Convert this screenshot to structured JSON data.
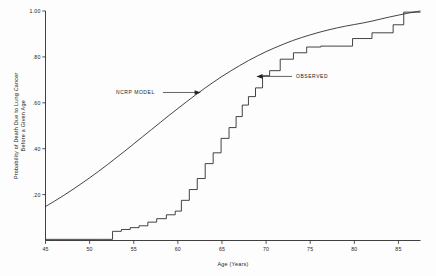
{
  "chart_data": {
    "type": "line",
    "title": "",
    "xlabel": "Age (Years)",
    "ylabel": "Probability of Death Due to Lung Cancer Before a Given Age",
    "ylabel_line1": "Probability of Death Due to Lung Cancer",
    "ylabel_line2": "Before a Given Age",
    "xlim": [
      45,
      87.5
    ],
    "ylim": [
      0,
      1.0
    ],
    "grid": false,
    "legend_position": "inline-annotations",
    "xticks": [
      45,
      50,
      55,
      60,
      65,
      70,
      75,
      80,
      85
    ],
    "xtick_labels": [
      "45",
      "50",
      "55",
      "60",
      "65",
      "70",
      "75",
      "80",
      "85"
    ],
    "yticks": [
      0.2,
      0.4,
      0.6,
      0.8,
      1.0
    ],
    "ytick_labels": [
      ".20",
      ".40",
      ".60",
      ".80",
      "1.00"
    ],
    "annotations": [
      {
        "text": "NCRP MODEL",
        "points_to": "ncrp-model-curve",
        "arrow_direction": "right"
      },
      {
        "text": "OBSERVED",
        "points_to": "observed-step-curve",
        "arrow_direction": "left"
      }
    ],
    "series": [
      {
        "name": "NCRP MODEL",
        "style": "smooth",
        "x": [
          45,
          46,
          47,
          48,
          49,
          50,
          51,
          52,
          53,
          54,
          55,
          56,
          57,
          58,
          59,
          60,
          61,
          62,
          63,
          64,
          65,
          66,
          67,
          68,
          69,
          70,
          71,
          72,
          73,
          74,
          75,
          76,
          77,
          78,
          79,
          80,
          81,
          82,
          83,
          84,
          85,
          86,
          87,
          87.5
        ],
        "values": [
          0.148,
          0.171,
          0.195,
          0.22,
          0.246,
          0.273,
          0.301,
          0.33,
          0.36,
          0.39,
          0.421,
          0.452,
          0.483,
          0.514,
          0.545,
          0.575,
          0.605,
          0.634,
          0.662,
          0.689,
          0.715,
          0.739,
          0.762,
          0.784,
          0.804,
          0.823,
          0.84,
          0.856,
          0.871,
          0.884,
          0.896,
          0.907,
          0.917,
          0.926,
          0.934,
          0.941,
          0.948,
          0.956,
          0.965,
          0.974,
          0.982,
          0.99,
          0.997,
          1.0
        ]
      },
      {
        "name": "OBSERVED",
        "style": "step",
        "x": [
          45,
          51.5,
          52.6,
          53.6,
          54.6,
          55.6,
          56.6,
          57.6,
          58.7,
          59.7,
          60.4,
          61.3,
          62.2,
          63.1,
          64.0,
          64.9,
          65.8,
          66.6,
          67.3,
          68.0,
          68.8,
          69.6,
          70.4,
          71.6,
          73.1,
          74.6,
          76.2,
          77.9,
          79.8,
          82.0,
          84.4,
          85.6,
          87.5
        ],
        "values": [
          0.005,
          0.005,
          0.04,
          0.048,
          0.056,
          0.064,
          0.08,
          0.095,
          0.112,
          0.128,
          0.175,
          0.222,
          0.27,
          0.335,
          0.382,
          0.445,
          0.492,
          0.54,
          0.59,
          0.627,
          0.665,
          0.718,
          0.74,
          0.79,
          0.818,
          0.843,
          0.847,
          0.847,
          0.88,
          0.905,
          0.94,
          0.995,
          0.995
        ]
      }
    ]
  },
  "colors": {
    "background": "#fdfdfd",
    "axis": "#2a2a2a",
    "curve": "#222222",
    "text": "#1c1c1c"
  }
}
